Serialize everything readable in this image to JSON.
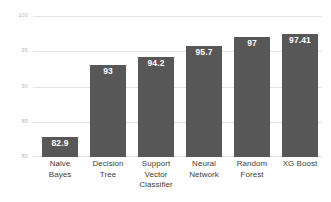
{
  "chart_data": {
    "type": "bar",
    "title": "",
    "subtitle": "",
    "xlabel": "",
    "ylabel": "",
    "ylim": [
      80,
      100
    ],
    "yticks": [
      80,
      85,
      90,
      95,
      100
    ],
    "ytick_labels": [
      "80",
      "85",
      "90",
      "95",
      "100"
    ],
    "grid": "horizontal",
    "legend": "none",
    "orientation": "vertical",
    "bar_color": "#575757",
    "gridline_color": "#e4e4e4",
    "value_label_color": "#ffffff",
    "ytick_label_color": "#b9b9b9",
    "category_label_color": "#3d3d3d",
    "background_color": "#ffffff",
    "categories": [
      "Naive Bayes",
      "Decision Tree",
      "Support Vector Classifier",
      "Neural Network",
      "Random Forest",
      "XG Boost"
    ],
    "category_lines": [
      [
        "Naive",
        "Bayes"
      ],
      [
        "Decision",
        "Tree"
      ],
      [
        "Support",
        "Vector",
        "Classifier"
      ],
      [
        "Neural",
        "Network"
      ],
      [
        "Random",
        "Forest"
      ],
      [
        "XG Boost"
      ]
    ],
    "values": [
      82.9,
      93,
      94.2,
      95.7,
      97,
      97.41
    ],
    "value_labels": [
      "82.9",
      "93",
      "94.2",
      "95.7",
      "97",
      "97.41"
    ],
    "series": [
      {
        "name": "Accuracy",
        "values": [
          82.9,
          93,
          94.2,
          95.7,
          97,
          97.41
        ]
      }
    ]
  }
}
